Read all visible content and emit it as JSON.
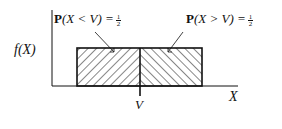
{
  "diagram": {
    "type": "uniform-density-median",
    "y_axis_label": "f(X)",
    "x_axis_label": "X",
    "median_label": "V",
    "left_region": {
      "label_prefix": "P",
      "label_expr": "(X < V) =",
      "prob_num": "1",
      "prob_den": "2",
      "hatch": "backslash"
    },
    "right_region": {
      "label_prefix": "P",
      "label_expr": "(X > V) =",
      "prob_num": "1",
      "prob_den": "2",
      "hatch": "slash"
    },
    "colors": {
      "ink": "#111111",
      "background": "#ffffff"
    }
  }
}
